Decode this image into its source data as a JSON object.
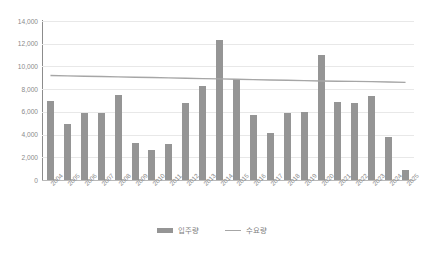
{
  "chart_data": {
    "type": "bar",
    "title": "",
    "subtitle": "",
    "xlabel": "",
    "ylabel": "",
    "ylim": [
      0,
      14000
    ],
    "ytick_step": 2000,
    "ytick_labels": [
      "14,000",
      "12,000",
      "10,000",
      "8,000",
      "6,000",
      "4,000",
      "2,000",
      "0"
    ],
    "ytick_values": [
      14000,
      12000,
      10000,
      8000,
      6000,
      4000,
      2000,
      0
    ],
    "grid": true,
    "legend_position": "bottom",
    "categories": [
      "2004",
      "2005",
      "2006",
      "2007",
      "2008",
      "2009",
      "2010",
      "2011",
      "2012",
      "2013",
      "2014",
      "2015",
      "2016",
      "2017",
      "2018",
      "2019",
      "2020",
      "2021",
      "2022",
      "2023",
      "2024",
      "2025"
    ],
    "series": [
      {
        "name": "입주량",
        "type": "bar",
        "color": "#959595",
        "values": [
          7000,
          4900,
          5900,
          5900,
          7500,
          3300,
          2600,
          3200,
          6800,
          8300,
          12300,
          8900,
          5700,
          4100,
          5900,
          6000,
          11000,
          6900,
          6800,
          7400,
          3800,
          900
        ]
      },
      {
        "name": "수요량",
        "type": "line",
        "color": "#a6a6a6",
        "values": [
          9200,
          9170,
          9140,
          9110,
          9080,
          9050,
          9020,
          8990,
          8960,
          8930,
          8900,
          8870,
          8840,
          8810,
          8780,
          8750,
          8720,
          8700,
          8680,
          8660,
          8630,
          8600
        ]
      }
    ]
  },
  "legend": {
    "items": [
      {
        "label": "입주량",
        "marker": "bar-swatch",
        "color": "#959595"
      },
      {
        "label": "수요량",
        "marker": "line-swatch",
        "color": "#a6a6a6"
      }
    ]
  },
  "colors": {
    "bar": "#959595",
    "line": "#a6a6a6",
    "grid": "#e8e8e8",
    "axis": "#8c8c8c",
    "text": "#8a8a8a",
    "background": "#ffffff"
  }
}
